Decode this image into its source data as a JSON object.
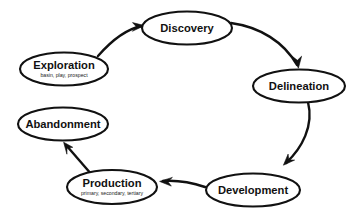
{
  "diagram": {
    "type": "cycle-flow-diagram",
    "background_color": "#ffffff",
    "stroke_color": "#111111",
    "node_fill_color": "#ffffff",
    "nodes": [
      {
        "id": "discovery",
        "label": "Discovery",
        "sublabel": "",
        "cx": 187,
        "cy": 28,
        "rx": 45,
        "ry": 16.5
      },
      {
        "id": "delineation",
        "label": "Delineation",
        "sublabel": "",
        "cx": 299,
        "cy": 86,
        "rx": 46,
        "ry": 16.5
      },
      {
        "id": "development",
        "label": "Development",
        "sublabel": "",
        "cx": 253,
        "cy": 190,
        "rx": 47,
        "ry": 16.5
      },
      {
        "id": "production",
        "label": "Production",
        "sublabel": "primary, secondary, tertiary",
        "cx": 112,
        "cy": 187,
        "rx": 45,
        "ry": 17
      },
      {
        "id": "abandonment",
        "label": "Abandonment",
        "sublabel": "",
        "cx": 63,
        "cy": 124,
        "rx": 45,
        "ry": 16.5
      },
      {
        "id": "exploration",
        "label": "Exploration",
        "sublabel": "basin, play, prospect",
        "cx": 64,
        "cy": 69,
        "rx": 44,
        "ry": 16.5
      }
    ],
    "edges": [
      {
        "id": "exploration-to-discovery",
        "from": "exploration",
        "to": "discovery",
        "style": "curved",
        "direction": "clockwise"
      },
      {
        "id": "discovery-to-delineation",
        "from": "discovery",
        "to": "delineation",
        "style": "curved",
        "direction": "clockwise"
      },
      {
        "id": "delineation-to-development",
        "from": "delineation",
        "to": "development",
        "style": "curved",
        "direction": "clockwise"
      },
      {
        "id": "development-to-production",
        "from": "development",
        "to": "production",
        "style": "curved",
        "direction": "clockwise"
      },
      {
        "id": "production-to-abandonment",
        "from": "production",
        "to": "abandonment",
        "style": "straight",
        "direction": "clockwise"
      }
    ]
  }
}
